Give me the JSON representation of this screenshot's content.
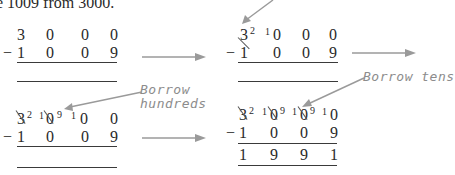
{
  "intro_text": "e 1009 from 3000.",
  "steps": [
    {
      "label": "step-1",
      "minuend": [
        "3",
        "0",
        "0",
        "0"
      ],
      "subtrahend": [
        "1",
        "0",
        "0",
        "9"
      ],
      "operator": "−",
      "result": [
        "",
        "",
        "",
        ""
      ]
    },
    {
      "label": "step-2",
      "minuend_crossed": [
        "3",
        "",
        "",
        ""
      ],
      "minuend_new": [
        "2",
        "",
        "",
        ""
      ],
      "borrowed_prefix": [
        "",
        "1",
        "",
        ""
      ],
      "minuend": [
        "3",
        "0",
        "0",
        "0"
      ],
      "subtrahend": [
        "1",
        "0",
        "0",
        "9"
      ],
      "operator": "−",
      "result": [
        "",
        "",
        "",
        ""
      ]
    },
    {
      "label": "step-3",
      "minuend": [
        "3",
        "0",
        "0",
        "0"
      ],
      "minuend_new": [
        "2",
        "9",
        "",
        ""
      ],
      "borrowed_prefix": [
        "",
        "1",
        "1",
        ""
      ],
      "subtrahend": [
        "1",
        "0",
        "0",
        "9"
      ],
      "operator": "−",
      "result": [
        "",
        "",
        "",
        ""
      ],
      "annotation": [
        "Borrow",
        "hundreds"
      ]
    },
    {
      "label": "step-4",
      "minuend": [
        "3",
        "0",
        "0",
        "0"
      ],
      "minuend_new": [
        "2",
        "9",
        "9",
        ""
      ],
      "borrowed_prefix": [
        "",
        "1",
        "1",
        "1"
      ],
      "subtrahend": [
        "1",
        "0",
        "0",
        "9"
      ],
      "operator": "−",
      "result": [
        "1",
        "9",
        "9",
        "1"
      ],
      "annotation": [
        "Borrow tens"
      ]
    }
  ],
  "colors": {
    "text": "#2a2a2a",
    "annotation": "#8c8c8c",
    "arrow": "#9a9a9a"
  }
}
